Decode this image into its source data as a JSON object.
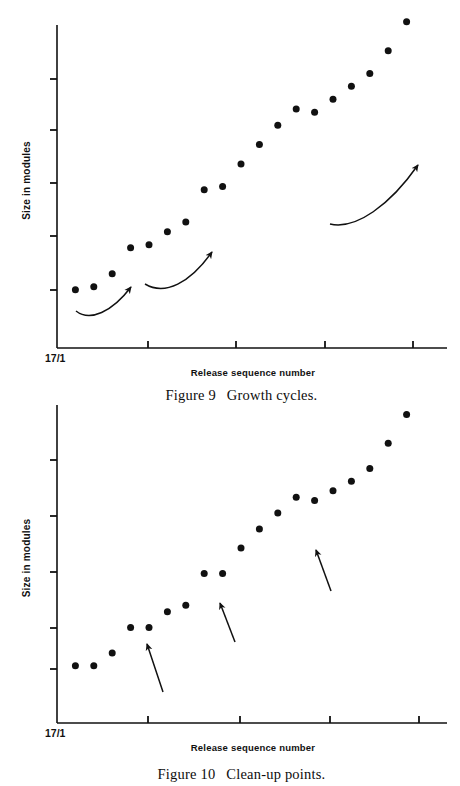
{
  "document": {
    "kind": "scanned-book-figure-page",
    "background_color": "#ffffff",
    "ink_color": "#111111"
  },
  "figures": [
    {
      "id": "figure-9",
      "caption_label": "Figure 9",
      "caption_text": "Growth cycles.",
      "x_axis_label": "Release sequence number",
      "y_axis_label": "Size in modules",
      "origin_tick_label": "17/1",
      "chart_data": {
        "type": "scatter",
        "title": "Figure 9   Growth cycles.",
        "xlabel": "Release sequence number",
        "ylabel": "Size in modules",
        "grid": false,
        "legend": "none",
        "x_tick_labels": [
          "17/1",
          "",
          "",
          "",
          ""
        ],
        "y_tick_labels": [
          "",
          "",
          "",
          "",
          ""
        ],
        "n_x_ticks": 5,
        "n_y_ticks": 5,
        "xlim": [
          0,
          20
        ],
        "ylim": [
          0,
          100
        ],
        "x": [
          1,
          2,
          3,
          4,
          5,
          6,
          7,
          8,
          9,
          10,
          11,
          12,
          13,
          14,
          15,
          16,
          17,
          18,
          19
        ],
        "values": [
          18,
          19,
          23,
          31,
          32,
          36,
          39,
          49,
          50,
          57,
          63,
          69,
          74,
          73,
          77,
          81,
          85,
          92,
          101
        ],
        "annotations": [
          {
            "kind": "curved-arrow",
            "label": "growth-cycle-arrow-1"
          },
          {
            "kind": "curved-arrow",
            "label": "growth-cycle-arrow-2"
          },
          {
            "kind": "curved-arrow",
            "label": "growth-cycle-arrow-3"
          }
        ]
      }
    },
    {
      "id": "figure-10",
      "caption_label": "Figure 10",
      "caption_text": "Clean-up points.",
      "x_axis_label": "Release sequence number",
      "y_axis_label": "Size in modules",
      "origin_tick_label": "17/1",
      "chart_data": {
        "type": "scatter",
        "title": "Figure 10   Clean-up points.",
        "xlabel": "Release sequence number",
        "ylabel": "Size in modules",
        "grid": false,
        "legend": "none",
        "x_tick_labels": [
          "17/1",
          "",
          "",
          "",
          ""
        ],
        "y_tick_labels": [
          "",
          "",
          "",
          "",
          ""
        ],
        "n_x_ticks": 5,
        "n_y_ticks": 5,
        "xlim": [
          0,
          20
        ],
        "ylim": [
          0,
          100
        ],
        "x": [
          1,
          2,
          3,
          4,
          5,
          6,
          7,
          8,
          9,
          10,
          11,
          12,
          13,
          14,
          15,
          16,
          17,
          18,
          19
        ],
        "values": [
          18,
          18,
          22,
          30,
          30,
          35,
          37,
          47,
          47,
          55,
          61,
          66,
          71,
          70,
          73,
          76,
          80,
          88,
          97
        ],
        "annotations": [
          {
            "kind": "straight-arrow",
            "label": "clean-up-point-arrow-1"
          },
          {
            "kind": "straight-arrow",
            "label": "clean-up-point-arrow-2"
          },
          {
            "kind": "straight-arrow",
            "label": "clean-up-point-arrow-3"
          }
        ]
      }
    }
  ]
}
